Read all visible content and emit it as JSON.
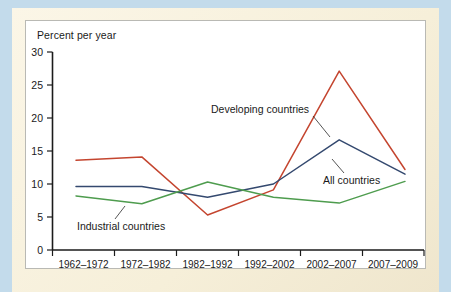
{
  "figure": {
    "y_axis_title": "Percent per year",
    "background_color": "#c3dbeb",
    "paper_color": "#f8f1dd",
    "card_color": "#ffffff"
  },
  "chart_data": {
    "type": "line",
    "title": "",
    "subtitle": "",
    "xlabel": "",
    "ylabel": "Percent per year",
    "categories": [
      "1962–1972",
      "1972–1982",
      "1982–1992",
      "1992–2002",
      "2002–2007",
      "2007–2009"
    ],
    "ylim": [
      0,
      30
    ],
    "yticks": [
      0,
      5,
      10,
      15,
      20,
      25,
      30
    ],
    "ytick_labels": [
      "0",
      "5",
      "10",
      "15",
      "20",
      "25",
      "30"
    ],
    "grid": false,
    "legend": "inline-annotations",
    "series": [
      {
        "name": "Developing countries",
        "color": "#c4452f",
        "values": [
          13.6,
          14.1,
          5.3,
          9.1,
          27.1,
          12.2
        ]
      },
      {
        "name": "All countries",
        "color": "#34496f",
        "values": [
          9.6,
          9.6,
          8.0,
          10.0,
          16.7,
          11.5
        ]
      },
      {
        "name": "Industrial countries",
        "color": "#4e9c4e",
        "values": [
          8.2,
          7.0,
          10.3,
          8.0,
          7.1,
          10.4
        ]
      }
    ],
    "annotations": [
      {
        "text": "Developing countries",
        "series": "Developing countries"
      },
      {
        "text": "All countries",
        "series": "All countries"
      },
      {
        "text": "Industrial countries",
        "series": "Industrial countries"
      }
    ]
  }
}
